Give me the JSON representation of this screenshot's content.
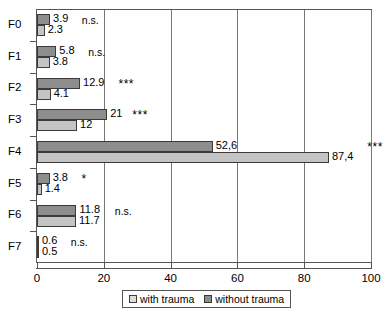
{
  "chart_data": {
    "type": "bar",
    "orientation": "horizontal",
    "title": "",
    "xlabel": "",
    "ylabel": "",
    "categories": [
      "F0",
      "F1",
      "F2",
      "F3",
      "F4",
      "F5",
      "F6",
      "F7"
    ],
    "xlim": [
      0,
      100
    ],
    "xticks": [
      0,
      20,
      40,
      60,
      80,
      100
    ],
    "xtick_labels": [
      "0",
      "20",
      "40",
      "60",
      "80",
      "100"
    ],
    "grid": true,
    "grid_axis": "x",
    "legend_position": "bottom",
    "series": [
      {
        "name": "without trauma",
        "color": "#8d8d8d",
        "values": [
          3.9,
          5.8,
          12.9,
          21,
          52.6,
          3.8,
          11.8,
          0.6
        ],
        "value_labels": [
          "3.9",
          "5.8",
          "12.9",
          "21",
          "52,6",
          "3.8",
          "11.8",
          "0.6"
        ]
      },
      {
        "name": "with trauma",
        "color": "#c4c4c4",
        "values": [
          2.3,
          3.8,
          4.1,
          12,
          87.4,
          1.4,
          11.7,
          0.5
        ],
        "value_labels": [
          "2.3",
          "3.8",
          "4.1",
          "12",
          "87,4",
          "1.4",
          "11.7",
          "0.5"
        ]
      }
    ],
    "annotations": [
      {
        "category": "F0",
        "text": "n.s."
      },
      {
        "category": "F1",
        "text": "n.s."
      },
      {
        "category": "F2",
        "text": "***"
      },
      {
        "category": "F3",
        "text": "***"
      },
      {
        "category": "F4",
        "text": "***"
      },
      {
        "category": "F5",
        "text": "*"
      },
      {
        "category": "F6",
        "text": "n.s."
      },
      {
        "category": "F7",
        "text": "n.s."
      }
    ]
  },
  "legend": {
    "items": [
      {
        "label": "with trauma",
        "swatch": "with"
      },
      {
        "label": "without trauma",
        "swatch": "without"
      }
    ]
  },
  "rows": [
    {
      "cat": "F0",
      "top_label": "3.9",
      "bottom_label": "2.3",
      "sig": "n.s."
    },
    {
      "cat": "F1",
      "top_label": "5.8",
      "bottom_label": "3.8",
      "sig": "n.s."
    },
    {
      "cat": "F2",
      "top_label": "12.9",
      "bottom_label": "4.1",
      "sig": "***"
    },
    {
      "cat": "F3",
      "top_label": "21",
      "bottom_label": "12",
      "sig": "***"
    },
    {
      "cat": "F4",
      "top_label": "52,6",
      "bottom_label": "87,4",
      "sig": "***"
    },
    {
      "cat": "F5",
      "top_label": "3.8",
      "bottom_label": "1.4",
      "sig": "*"
    },
    {
      "cat": "F6",
      "top_label": "11.8",
      "bottom_label": "11.7",
      "sig": "n.s."
    },
    {
      "cat": "F7",
      "top_label": "0.6",
      "bottom_label": "0.5",
      "sig": "n.s."
    }
  ]
}
